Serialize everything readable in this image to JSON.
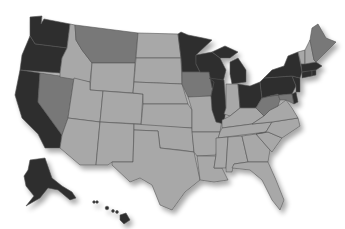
{
  "map": {
    "type": "choropleth",
    "region": "United States",
    "palette": {
      "dark": "#2e2e2e",
      "medium": "#787878",
      "light": "#a8a8a8",
      "border": "#555555",
      "background": "#ffffff"
    },
    "states": {
      "WA": "dark",
      "OR": "dark",
      "CA": "dark",
      "NV": "medium",
      "ID": "light",
      "MT": "medium",
      "WY": "light",
      "UT": "light",
      "AZ": "light",
      "CO": "light",
      "NM": "light",
      "ND": "light",
      "SD": "light",
      "NE": "light",
      "KS": "light",
      "OK": "light",
      "TX": "light",
      "MN": "dark",
      "IA": "medium",
      "MO": "light",
      "AR": "light",
      "LA": "light",
      "WI": "dark",
      "IL": "dark",
      "MI": "dark",
      "IN": "light",
      "OH": "dark",
      "KY": "light",
      "TN": "light",
      "MS": "light",
      "AL": "light",
      "GA": "light",
      "FL": "light",
      "SC": "light",
      "NC": "light",
      "VA": "light",
      "WV": "medium",
      "PA": "dark",
      "NY": "dark",
      "NJ": "dark",
      "DE": "dark",
      "MD": "medium",
      "CT": "dark",
      "RI": "dark",
      "MA": "dark",
      "VT": "light",
      "NH": "light",
      "ME": "medium",
      "AK": "dark",
      "HI": "dark"
    }
  }
}
